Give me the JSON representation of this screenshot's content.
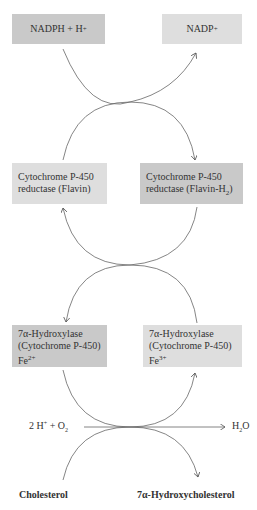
{
  "diagram": {
    "boxes": {
      "nadph": {
        "text": "NADPH + H",
        "sup": "+"
      },
      "nadp": {
        "text": "NADP",
        "sup": "+"
      },
      "flavin": {
        "line1": "Cytochrome P-450",
        "line2": "reductase (Flavin)"
      },
      "flavin_h2": {
        "line1": "Cytochrome P-450",
        "line2": "reductase (Flavin-H",
        "sub": "2",
        "close": ")"
      },
      "hydroxylase_fe2": {
        "line1": "7α-Hydroxylase",
        "line2": "(Cytochrome P-450)",
        "line3": "Fe",
        "sup": "2+"
      },
      "hydroxylase_fe3": {
        "line1": "7α-Hydroxylase",
        "line2": "(Cytochrome P-450)",
        "line3": "Fe",
        "sup": "3+"
      }
    },
    "reactants": {
      "protons_oxygen": {
        "a": "2 H",
        "a_sup": "+",
        "b": " + O",
        "b_sub": "2"
      },
      "water": {
        "a": "H",
        "a_sub": "2",
        "b": "O"
      },
      "cholesterol": "Cholesterol",
      "product": "7α-Hydroxycholesterol"
    },
    "colors": {
      "dark_box": "#c9c9c9",
      "light_box": "#dedede",
      "line": "#555555"
    }
  }
}
